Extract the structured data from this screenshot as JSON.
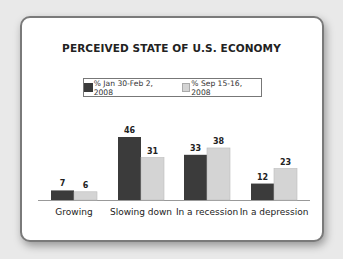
{
  "chart_data": {
    "type": "bar",
    "title": "PERCEIVED STATE OF U.S. ECONOMY",
    "categories": [
      "Growing",
      "Slowing down",
      "In a recession",
      "In a depression"
    ],
    "series": [
      {
        "name": "% Jan 30-Feb 2, 2008",
        "values": [
          7,
          46,
          33,
          12
        ],
        "color": "#3b3b3b"
      },
      {
        "name": "% Sep 15-16, 2008",
        "values": [
          6,
          31,
          38,
          23
        ],
        "color": "#d4d4d4"
      }
    ],
    "xlabel": "",
    "ylabel": "",
    "ylim": [
      0,
      50
    ],
    "grid": false,
    "legend_position": "top-center",
    "data_labels": true
  }
}
